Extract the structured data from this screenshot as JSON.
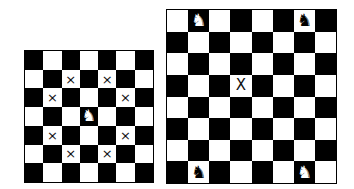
{
  "colors": {
    "dark": "#000000",
    "light": "#ffffff",
    "mark": "#111111",
    "knight_on_dark": "#ffffff",
    "knight_on_light": "#000000"
  },
  "icons": {
    "knight": "♞",
    "mark": "×",
    "mark_large": "X"
  },
  "left_board": {
    "size": 7,
    "top_left_dark": true,
    "knights": [
      {
        "row": 3,
        "col": 3
      }
    ],
    "marks": [
      {
        "row": 1,
        "col": 2
      },
      {
        "row": 1,
        "col": 4
      },
      {
        "row": 2,
        "col": 1
      },
      {
        "row": 2,
        "col": 5
      },
      {
        "row": 4,
        "col": 1
      },
      {
        "row": 4,
        "col": 5
      },
      {
        "row": 5,
        "col": 2
      },
      {
        "row": 5,
        "col": 4
      }
    ],
    "mark_glyph": "×"
  },
  "right_board": {
    "size": 8,
    "top_left_dark": false,
    "knights": [
      {
        "row": 0,
        "col": 1
      },
      {
        "row": 0,
        "col": 6
      },
      {
        "row": 7,
        "col": 1
      },
      {
        "row": 7,
        "col": 6
      }
    ],
    "marks": [
      {
        "row": 3,
        "col": 3
      }
    ],
    "mark_glyph": "X"
  }
}
